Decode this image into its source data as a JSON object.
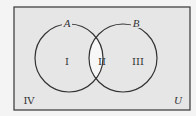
{
  "diagram": {
    "type": "venn",
    "universe_label": "U",
    "sets": [
      {
        "name": "A",
        "label": "A"
      },
      {
        "name": "B",
        "label": "B"
      }
    ],
    "regions": [
      {
        "id": "I",
        "label": "I",
        "description": "A only"
      },
      {
        "id": "II",
        "label": "II",
        "description": "A and B"
      },
      {
        "id": "III",
        "label": "III",
        "description": "B only"
      },
      {
        "id": "IV",
        "label": "IV",
        "description": "neither A nor B"
      }
    ],
    "colors": {
      "background": "#e6e6e6",
      "intersection": "#f7f7f7",
      "stroke": "#333333"
    }
  }
}
